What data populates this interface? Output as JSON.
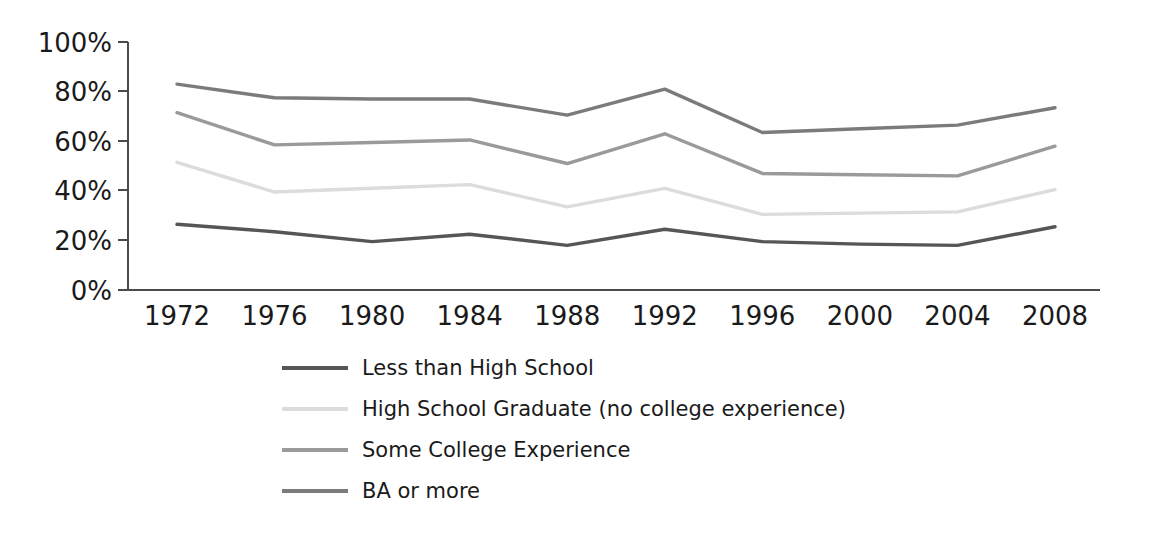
{
  "chart_data": {
    "type": "line",
    "title": "",
    "subtitle": "",
    "xlabel": "",
    "ylabel": "",
    "x": [
      1972,
      1976,
      1980,
      1984,
      1988,
      1992,
      1996,
      2000,
      2004,
      2008
    ],
    "categories": [
      "1972",
      "1976",
      "1980",
      "1984",
      "1988",
      "1992",
      "1996",
      "2000",
      "2004",
      "2008"
    ],
    "xtick_labels": [
      "1972",
      "1976",
      "1980",
      "1984",
      "1988",
      "1992",
      "1996",
      "2000",
      "2004",
      "2008"
    ],
    "ytick_labels": [
      "0%",
      "20%",
      "40%",
      "60%",
      "80%",
      "100%"
    ],
    "ytick_values": [
      0,
      20,
      40,
      60,
      80,
      100
    ],
    "ylim": [
      0,
      100
    ],
    "xlim": [
      1972,
      2008
    ],
    "grid": false,
    "legend_position": "below-center",
    "series": [
      {
        "name": "Less than High School",
        "color": "#565656",
        "values": [
          26.5,
          23.5,
          19.5,
          22.5,
          18.0,
          24.5,
          19.5,
          18.5,
          18.0,
          25.5
        ]
      },
      {
        "name": "High School Graduate (no college experience)",
        "color": "#dcdcdc",
        "values": [
          51.5,
          39.5,
          41.0,
          42.5,
          33.5,
          41.0,
          30.5,
          31.0,
          31.5,
          40.5
        ]
      },
      {
        "name": "Some College Experience",
        "color": "#9a9a9a",
        "values": [
          71.5,
          58.5,
          59.5,
          60.5,
          51.0,
          63.0,
          47.0,
          46.5,
          46.0,
          58.0
        ]
      },
      {
        "name": "BA or more",
        "color": "#7b7b7b",
        "values": [
          83.0,
          77.5,
          77.0,
          77.0,
          70.5,
          81.0,
          63.5,
          65.0,
          66.5,
          73.5
        ]
      }
    ],
    "legend_entries": [
      {
        "label": "Less than High School",
        "color": "#565656"
      },
      {
        "label": "High School Graduate (no college experience)",
        "color": "#dcdcdc"
      },
      {
        "label": "Some College Experience",
        "color": "#9a9a9a"
      },
      {
        "label": "BA or more",
        "color": "#7b7b7b"
      }
    ]
  },
  "axes": {
    "y_axis_name": "percentage-axis",
    "x_axis_name": "year-axis"
  }
}
